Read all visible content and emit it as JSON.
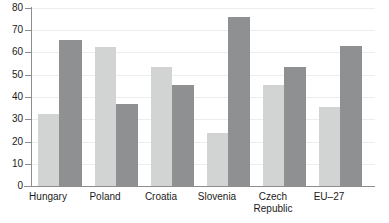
{
  "chart_data": {
    "type": "bar",
    "title": "",
    "subtitle": "",
    "xlabel": "",
    "ylabel": "",
    "ylim": [
      0,
      80
    ],
    "yticks": [
      0,
      10,
      20,
      30,
      40,
      50,
      60,
      70,
      80
    ],
    "ytick_labels": [
      "0",
      "10",
      "20",
      "30",
      "40",
      "50",
      "60",
      "70",
      "80"
    ],
    "grid": "horizontal",
    "legend": "none",
    "categories": [
      "Hungary",
      "Poland",
      "Croatia",
      "Slovenia",
      "Czech\nRepublic",
      "EU–27"
    ],
    "category_labels_plain": [
      "Hungary",
      "Poland",
      "Croatia",
      "Slovenia",
      "Czech Republic",
      "EU-27"
    ],
    "series": [
      {
        "name": "series-1-light",
        "color": "#d2d3d3",
        "values": [
          32.5,
          62.5,
          53.5,
          23.8,
          45.5,
          35.5
        ]
      },
      {
        "name": "series-2-dark",
        "color": "#8f9092",
        "values": [
          65.5,
          37.0,
          45.5,
          76.0,
          53.5,
          63.0
        ]
      }
    ],
    "colors": {
      "series_light": "#d2d3d3",
      "series_dark": "#8f9092",
      "axis": "#8b8d8f",
      "grid": "#eceded",
      "text": "#1b1b1b",
      "background": "#ffffff"
    }
  }
}
